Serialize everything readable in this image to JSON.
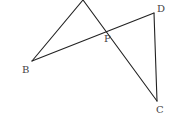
{
  "diagram": {
    "type": "geometry",
    "stroke_color": "#222222",
    "label_color": "#444444",
    "points": {
      "A": {
        "x": 83,
        "y": 0,
        "label": ""
      },
      "B": {
        "x": 32,
        "y": 61,
        "label": "B"
      },
      "P": {
        "x": 110,
        "y": 31,
        "label": "P"
      },
      "D": {
        "x": 154,
        "y": 13,
        "label": "D"
      },
      "C": {
        "x": 157,
        "y": 101,
        "label": "C"
      }
    },
    "segments": [
      [
        "A",
        "B"
      ],
      [
        "A",
        "C"
      ],
      [
        "B",
        "D"
      ],
      [
        "D",
        "C"
      ]
    ],
    "labels": {
      "B": "B",
      "P": "P",
      "D": "D",
      "C": "C"
    }
  }
}
